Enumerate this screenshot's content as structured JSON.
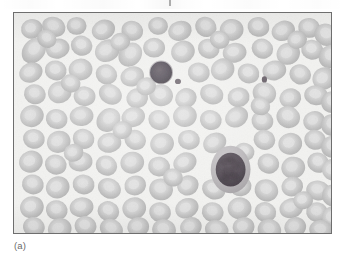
{
  "figure": {
    "caption_label": "(a)",
    "panel_letter": "a",
    "alt_description": "Light micrograph of a peripheral blood smear showing numerous pale grey erythrocytes with two darkly stained leukocytes and scattered platelets",
    "colors": {
      "plate_background": "#f2f2f0",
      "plate_border": "#6e6e6e",
      "erythrocyte_body": "#c5c5c5",
      "erythrocyte_center": "#dcdcdc",
      "erythrocyte_edge": "#b0b0b0",
      "leukocyte_nucleus": "#585058",
      "leukocyte_nucleus_dark": "#463f46",
      "leukocyte_cytoplasm": "#a9a5a9",
      "platelet": "#6a626a",
      "caption_text": "#6b6b6b"
    },
    "plate": {
      "x": 13,
      "y": 12,
      "width": 319,
      "height": 222
    }
  },
  "smear": {
    "background": "#f2f2f0",
    "erythrocyte_count": 139,
    "leukocyte_count": 2,
    "platelet_count": 2,
    "erythrocytes": [
      {
        "x": 18,
        "y": 16,
        "rx": 11,
        "ry": 10,
        "rot": -12
      },
      {
        "x": 40,
        "y": 14,
        "rx": 12,
        "ry": 10,
        "rot": 20
      },
      {
        "x": 63,
        "y": 13,
        "rx": 10,
        "ry": 9,
        "rot": 0
      },
      {
        "x": 90,
        "y": 17,
        "rx": 12,
        "ry": 10,
        "rot": -25
      },
      {
        "x": 119,
        "y": 18,
        "rx": 11,
        "ry": 10,
        "rot": 15
      },
      {
        "x": 145,
        "y": 13,
        "rx": 10,
        "ry": 9,
        "rot": 5
      },
      {
        "x": 167,
        "y": 18,
        "rx": 12,
        "ry": 10,
        "rot": -18
      },
      {
        "x": 193,
        "y": 14,
        "rx": 11,
        "ry": 10,
        "rot": 30
      },
      {
        "x": 219,
        "y": 17,
        "rx": 12,
        "ry": 11,
        "rot": -8
      },
      {
        "x": 246,
        "y": 14,
        "rx": 11,
        "ry": 10,
        "rot": 12
      },
      {
        "x": 271,
        "y": 18,
        "rx": 12,
        "ry": 10,
        "rot": -22
      },
      {
        "x": 297,
        "y": 15,
        "rx": 11,
        "ry": 10,
        "rot": 8
      },
      {
        "x": 314,
        "y": 22,
        "rx": 12,
        "ry": 11,
        "rot": 35
      },
      {
        "x": 20,
        "y": 38,
        "rx": 11,
        "ry": 14,
        "rot": 38
      },
      {
        "x": 44,
        "y": 36,
        "rx": 12,
        "ry": 10,
        "rot": -15
      },
      {
        "x": 68,
        "y": 33,
        "rx": 11,
        "ry": 10,
        "rot": 22
      },
      {
        "x": 94,
        "y": 38,
        "rx": 13,
        "ry": 11,
        "rot": -30
      },
      {
        "x": 117,
        "y": 42,
        "rx": 11,
        "ry": 13,
        "rot": 42
      },
      {
        "x": 141,
        "y": 35,
        "rx": 11,
        "ry": 10,
        "rot": 0
      },
      {
        "x": 170,
        "y": 39,
        "rx": 12,
        "ry": 11,
        "rot": -20
      },
      {
        "x": 196,
        "y": 36,
        "rx": 11,
        "ry": 10,
        "rot": 18
      },
      {
        "x": 222,
        "y": 40,
        "rx": 12,
        "ry": 10,
        "rot": -10
      },
      {
        "x": 250,
        "y": 36,
        "rx": 11,
        "ry": 10,
        "rot": 25
      },
      {
        "x": 276,
        "y": 41,
        "rx": 12,
        "ry": 11,
        "rot": -28
      },
      {
        "x": 300,
        "y": 37,
        "rx": 11,
        "ry": 10,
        "rot": 10
      },
      {
        "x": 318,
        "y": 44,
        "rx": 11,
        "ry": 12,
        "rot": 40
      },
      {
        "x": 17,
        "y": 60,
        "rx": 12,
        "ry": 10,
        "rot": -24
      },
      {
        "x": 42,
        "y": 58,
        "rx": 11,
        "ry": 10,
        "rot": 14
      },
      {
        "x": 67,
        "y": 57,
        "rx": 12,
        "ry": 11,
        "rot": -6
      },
      {
        "x": 93,
        "y": 62,
        "rx": 11,
        "ry": 10,
        "rot": 28
      },
      {
        "x": 119,
        "y": 64,
        "rx": 12,
        "ry": 10,
        "rot": -16
      },
      {
        "x": 186,
        "y": 60,
        "rx": 11,
        "ry": 10,
        "rot": 8
      },
      {
        "x": 210,
        "y": 57,
        "rx": 12,
        "ry": 11,
        "rot": -26
      },
      {
        "x": 236,
        "y": 61,
        "rx": 11,
        "ry": 10,
        "rot": 16
      },
      {
        "x": 262,
        "y": 58,
        "rx": 12,
        "ry": 10,
        "rot": -12
      },
      {
        "x": 288,
        "y": 62,
        "rx": 11,
        "ry": 10,
        "rot": 22
      },
      {
        "x": 312,
        "y": 66,
        "rx": 12,
        "ry": 11,
        "rot": -34
      },
      {
        "x": 21,
        "y": 82,
        "rx": 11,
        "ry": 10,
        "rot": 18
      },
      {
        "x": 46,
        "y": 80,
        "rx": 12,
        "ry": 11,
        "rot": -20
      },
      {
        "x": 71,
        "y": 84,
        "rx": 11,
        "ry": 10,
        "rot": 6
      },
      {
        "x": 97,
        "y": 82,
        "rx": 12,
        "ry": 10,
        "rot": 30
      },
      {
        "x": 124,
        "y": 86,
        "rx": 11,
        "ry": 10,
        "rot": -14
      },
      {
        "x": 148,
        "y": 83,
        "rx": 12,
        "ry": 11,
        "rot": 12
      },
      {
        "x": 173,
        "y": 86,
        "rx": 11,
        "ry": 10,
        "rot": -28
      },
      {
        "x": 199,
        "y": 82,
        "rx": 12,
        "ry": 10,
        "rot": 20
      },
      {
        "x": 226,
        "y": 85,
        "rx": 11,
        "ry": 10,
        "rot": -8
      },
      {
        "x": 252,
        "y": 81,
        "rx": 12,
        "ry": 11,
        "rot": 26
      },
      {
        "x": 278,
        "y": 86,
        "rx": 11,
        "ry": 10,
        "rot": -18
      },
      {
        "x": 304,
        "y": 83,
        "rx": 12,
        "ry": 10,
        "rot": 10
      },
      {
        "x": 320,
        "y": 90,
        "rx": 11,
        "ry": 11,
        "rot": 36
      },
      {
        "x": 18,
        "y": 104,
        "rx": 12,
        "ry": 11,
        "rot": -22
      },
      {
        "x": 43,
        "y": 107,
        "rx": 11,
        "ry": 10,
        "rot": 16
      },
      {
        "x": 68,
        "y": 104,
        "rx": 12,
        "ry": 10,
        "rot": -6
      },
      {
        "x": 95,
        "y": 108,
        "rx": 11,
        "ry": 13,
        "rot": 44
      },
      {
        "x": 120,
        "y": 105,
        "rx": 12,
        "ry": 10,
        "rot": -16
      },
      {
        "x": 146,
        "y": 108,
        "rx": 11,
        "ry": 10,
        "rot": 24
      },
      {
        "x": 172,
        "y": 104,
        "rx": 12,
        "ry": 11,
        "rot": -10
      },
      {
        "x": 198,
        "y": 108,
        "rx": 11,
        "ry": 10,
        "rot": 14
      },
      {
        "x": 224,
        "y": 105,
        "rx": 12,
        "ry": 10,
        "rot": -30
      },
      {
        "x": 250,
        "y": 109,
        "rx": 11,
        "ry": 10,
        "rot": 8
      },
      {
        "x": 276,
        "y": 105,
        "rx": 12,
        "ry": 11,
        "rot": 22
      },
      {
        "x": 302,
        "y": 109,
        "rx": 11,
        "ry": 10,
        "rot": -14
      },
      {
        "x": 320,
        "y": 113,
        "rx": 11,
        "ry": 11,
        "rot": 30
      },
      {
        "x": 20,
        "y": 127,
        "rx": 11,
        "ry": 10,
        "rot": 12
      },
      {
        "x": 45,
        "y": 130,
        "rx": 12,
        "ry": 11,
        "rot": -24
      },
      {
        "x": 70,
        "y": 127,
        "rx": 11,
        "ry": 10,
        "rot": 18
      },
      {
        "x": 96,
        "y": 131,
        "rx": 12,
        "ry": 10,
        "rot": -8
      },
      {
        "x": 122,
        "y": 128,
        "rx": 11,
        "ry": 10,
        "rot": 26
      },
      {
        "x": 149,
        "y": 132,
        "rx": 12,
        "ry": 11,
        "rot": -16
      },
      {
        "x": 176,
        "y": 128,
        "rx": 11,
        "ry": 10,
        "rot": 10
      },
      {
        "x": 202,
        "y": 131,
        "rx": 12,
        "ry": 10,
        "rot": -28
      },
      {
        "x": 252,
        "y": 128,
        "rx": 11,
        "ry": 10,
        "rot": 20
      },
      {
        "x": 278,
        "y": 132,
        "rx": 12,
        "ry": 11,
        "rot": -12
      },
      {
        "x": 303,
        "y": 128,
        "rx": 11,
        "ry": 10,
        "rot": 14
      },
      {
        "x": 320,
        "y": 135,
        "rx": 11,
        "ry": 11,
        "rot": 32
      },
      {
        "x": 17,
        "y": 150,
        "rx": 12,
        "ry": 11,
        "rot": -20
      },
      {
        "x": 42,
        "y": 153,
        "rx": 11,
        "ry": 10,
        "rot": 16
      },
      {
        "x": 67,
        "y": 150,
        "rx": 12,
        "ry": 10,
        "rot": -6
      },
      {
        "x": 93,
        "y": 154,
        "rx": 11,
        "ry": 10,
        "rot": 28
      },
      {
        "x": 119,
        "y": 151,
        "rx": 12,
        "ry": 11,
        "rot": -14
      },
      {
        "x": 146,
        "y": 155,
        "rx": 11,
        "ry": 10,
        "rot": 10
      },
      {
        "x": 172,
        "y": 151,
        "rx": 12,
        "ry": 10,
        "rot": -26
      },
      {
        "x": 256,
        "y": 152,
        "rx": 11,
        "ry": 10,
        "rot": 18
      },
      {
        "x": 281,
        "y": 156,
        "rx": 12,
        "ry": 11,
        "rot": -10
      },
      {
        "x": 306,
        "y": 151,
        "rx": 11,
        "ry": 10,
        "rot": 24
      },
      {
        "x": 321,
        "y": 158,
        "rx": 11,
        "ry": 11,
        "rot": -32
      },
      {
        "x": 19,
        "y": 173,
        "rx": 11,
        "ry": 10,
        "rot": 14
      },
      {
        "x": 44,
        "y": 176,
        "rx": 12,
        "ry": 11,
        "rot": -22
      },
      {
        "x": 70,
        "y": 173,
        "rx": 11,
        "ry": 10,
        "rot": 8
      },
      {
        "x": 96,
        "y": 177,
        "rx": 12,
        "ry": 10,
        "rot": 30
      },
      {
        "x": 122,
        "y": 174,
        "rx": 11,
        "ry": 10,
        "rot": -16
      },
      {
        "x": 148,
        "y": 178,
        "rx": 12,
        "ry": 11,
        "rot": 12
      },
      {
        "x": 175,
        "y": 174,
        "rx": 11,
        "ry": 10,
        "rot": -28
      },
      {
        "x": 201,
        "y": 178,
        "rx": 12,
        "ry": 10,
        "rot": 20
      },
      {
        "x": 228,
        "y": 175,
        "rx": 11,
        "ry": 10,
        "rot": -6
      },
      {
        "x": 254,
        "y": 179,
        "rx": 12,
        "ry": 11,
        "rot": 26
      },
      {
        "x": 280,
        "y": 175,
        "rx": 11,
        "ry": 10,
        "rot": -18
      },
      {
        "x": 306,
        "y": 179,
        "rx": 12,
        "ry": 10,
        "rot": 10
      },
      {
        "x": 321,
        "y": 184,
        "rx": 11,
        "ry": 11,
        "rot": 34
      },
      {
        "x": 18,
        "y": 196,
        "rx": 12,
        "ry": 11,
        "rot": -18
      },
      {
        "x": 43,
        "y": 199,
        "rx": 11,
        "ry": 10,
        "rot": 14
      },
      {
        "x": 68,
        "y": 196,
        "rx": 12,
        "ry": 10,
        "rot": -8
      },
      {
        "x": 95,
        "y": 200,
        "rx": 11,
        "ry": 10,
        "rot": 24
      },
      {
        "x": 121,
        "y": 197,
        "rx": 12,
        "ry": 11,
        "rot": -14
      },
      {
        "x": 147,
        "y": 201,
        "rx": 11,
        "ry": 10,
        "rot": 10
      },
      {
        "x": 174,
        "y": 197,
        "rx": 12,
        "ry": 10,
        "rot": -26
      },
      {
        "x": 200,
        "y": 201,
        "rx": 11,
        "ry": 10,
        "rot": 18
      },
      {
        "x": 227,
        "y": 197,
        "rx": 12,
        "ry": 11,
        "rot": -10
      },
      {
        "x": 253,
        "y": 201,
        "rx": 11,
        "ry": 10,
        "rot": 22
      },
      {
        "x": 279,
        "y": 197,
        "rx": 12,
        "ry": 10,
        "rot": -16
      },
      {
        "x": 305,
        "y": 201,
        "rx": 11,
        "ry": 10,
        "rot": 12
      },
      {
        "x": 321,
        "y": 206,
        "rx": 11,
        "ry": 11,
        "rot": -30
      },
      {
        "x": 20,
        "y": 216,
        "rx": 11,
        "ry": 10,
        "rot": 16
      },
      {
        "x": 46,
        "y": 218,
        "rx": 12,
        "ry": 11,
        "rot": -20
      },
      {
        "x": 72,
        "y": 215,
        "rx": 11,
        "ry": 10,
        "rot": 8
      },
      {
        "x": 98,
        "y": 218,
        "rx": 12,
        "ry": 10,
        "rot": 28
      },
      {
        "x": 125,
        "y": 216,
        "rx": 11,
        "ry": 10,
        "rot": -12
      },
      {
        "x": 151,
        "y": 219,
        "rx": 12,
        "ry": 11,
        "rot": 14
      },
      {
        "x": 178,
        "y": 216,
        "rx": 11,
        "ry": 10,
        "rot": -24
      },
      {
        "x": 204,
        "y": 219,
        "rx": 12,
        "ry": 10,
        "rot": 18
      },
      {
        "x": 231,
        "y": 216,
        "rx": 11,
        "ry": 10,
        "rot": -8
      },
      {
        "x": 257,
        "y": 219,
        "rx": 12,
        "ry": 11,
        "rot": 24
      },
      {
        "x": 283,
        "y": 216,
        "rx": 11,
        "ry": 10,
        "rot": -16
      },
      {
        "x": 309,
        "y": 219,
        "rx": 12,
        "ry": 10,
        "rot": 10
      },
      {
        "x": 33,
        "y": 26,
        "rx": 10,
        "ry": 9,
        "rot": 30
      },
      {
        "x": 107,
        "y": 29,
        "rx": 10,
        "ry": 9,
        "rot": -20
      },
      {
        "x": 207,
        "y": 27,
        "rx": 10,
        "ry": 9,
        "rot": 12
      },
      {
        "x": 285,
        "y": 27,
        "rx": 10,
        "ry": 9,
        "rot": -26
      },
      {
        "x": 57,
        "y": 71,
        "rx": 10,
        "ry": 9,
        "rot": 18
      },
      {
        "x": 133,
        "y": 74,
        "rx": 10,
        "ry": 9,
        "rot": -14
      },
      {
        "x": 248,
        "y": 94,
        "rx": 10,
        "ry": 9,
        "rot": 22
      },
      {
        "x": 109,
        "y": 118,
        "rx": 10,
        "ry": 9,
        "rot": -18
      },
      {
        "x": 232,
        "y": 140,
        "rx": 10,
        "ry": 9,
        "rot": 16
      },
      {
        "x": 60,
        "y": 141,
        "rx": 10,
        "ry": 9,
        "rot": -22
      },
      {
        "x": 160,
        "y": 166,
        "rx": 10,
        "ry": 9,
        "rot": 14
      },
      {
        "x": 291,
        "y": 189,
        "rx": 10,
        "ry": 9,
        "rot": -12
      }
    ],
    "leukocytes": [
      {
        "label": "lymphocyte",
        "x": 148,
        "y": 60,
        "nucleus_rx": 11,
        "nucleus_ry": 11,
        "cytoplasm_rx": 12,
        "cytoplasm_ry": 12,
        "nucleus_color": "#564f56",
        "cytoplasm_color": "#b3b0b3"
      },
      {
        "label": "monocyte",
        "x": 218,
        "y": 158,
        "nucleus_rx": 15,
        "nucleus_ry": 17,
        "cytoplasm_rx": 20,
        "cytoplasm_ry": 24,
        "nucleus_color": "#534c53",
        "cytoplasm_color": "#b8b5b8"
      }
    ],
    "platelets": [
      {
        "x": 165,
        "y": 69,
        "rx": 3.0,
        "ry": 2.6,
        "color": "#6f676f"
      },
      {
        "x": 252,
        "y": 67,
        "rx": 2.6,
        "ry": 3.2,
        "color": "#6a626a"
      }
    ]
  }
}
